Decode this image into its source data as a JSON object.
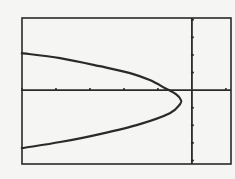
{
  "screen": {
    "background": "#f5f5f3",
    "ink": "#2a2a2a"
  },
  "chart_data": {
    "type": "line",
    "title": "",
    "xlabel": "",
    "ylabel": "",
    "grid": false,
    "legend": null,
    "units": "tick marks (1 tick = 1 unit)",
    "xlim": [
      -5,
      1.15
    ],
    "ylim": [
      -4.2,
      4.1
    ],
    "x_ticks": [
      -5,
      -4,
      -3,
      -2,
      -1,
      0,
      1
    ],
    "y_ticks": [
      -4,
      -3,
      -2,
      -1,
      0,
      1,
      2,
      3,
      4
    ],
    "vertex": {
      "x": -0.32,
      "y": -0.57
    },
    "x_intercept": -0.79,
    "series": [
      {
        "name": "parabola",
        "color": "#2a2a2a",
        "points": [
          {
            "x": -5.0,
            "y": 2.1
          },
          {
            "x": -3.88,
            "y": 1.82
          },
          {
            "x": -2.71,
            "y": 1.36
          },
          {
            "x": -1.82,
            "y": 0.97
          },
          {
            "x": -1.24,
            "y": 0.57
          },
          {
            "x": -0.79,
            "y": 0.11
          },
          {
            "x": -0.47,
            "y": -0.23
          },
          {
            "x": -0.32,
            "y": -0.57
          },
          {
            "x": -0.35,
            "y": -0.8
          },
          {
            "x": -0.65,
            "y": -1.31
          },
          {
            "x": -1.53,
            "y": -1.93
          },
          {
            "x": -2.71,
            "y": -2.5
          },
          {
            "x": -3.88,
            "y": -2.95
          },
          {
            "x": -5.0,
            "y": -3.3
          }
        ]
      }
    ]
  }
}
